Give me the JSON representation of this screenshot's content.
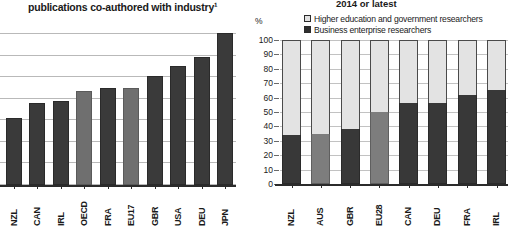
{
  "chart_data": [
    {
      "id": "left",
      "type": "bar",
      "title": "publications co-authored with industry¹",
      "xlabel": "",
      "ylabel": "",
      "grid": true,
      "gridlines": 8,
      "ylim": [
        0,
        100
      ],
      "categories": [
        "NZL",
        "CAN",
        "IRL",
        "OECD",
        "FRA",
        "EU17",
        "GBR",
        "USA",
        "DEU",
        "JPN"
      ],
      "values": [
        44,
        54,
        55,
        62,
        64,
        64,
        72,
        78,
        84,
        100
      ],
      "aggregate_categories": [
        "OECD",
        "EU17"
      ],
      "colors": {
        "bar": "#3a3a3a",
        "aggregate_bar": "#6f6f6f",
        "grid": "#b9b9b9"
      },
      "note": "y-axis tick labels are cropped out of frame on the left edge"
    },
    {
      "id": "right",
      "type": "bar",
      "subtype": "stacked-100",
      "title": "2014 or latest",
      "xlabel": "",
      "ylabel": "%",
      "grid": true,
      "ylim": [
        0,
        100
      ],
      "yticks": [
        100,
        90,
        80,
        70,
        60,
        50,
        40,
        30,
        20,
        10,
        0
      ],
      "legend_position": "top",
      "categories": [
        "NZL",
        "AUS",
        "GBR",
        "EU28",
        "CAN",
        "DEU",
        "FRA",
        "IRL"
      ],
      "series": [
        {
          "name": "Business enterprise researchers",
          "key": "business",
          "color": "#383838",
          "values": [
            34,
            35,
            38,
            50,
            56,
            56,
            62,
            65
          ]
        },
        {
          "name": "Higher education and government researchers",
          "key": "higher_ed_gov",
          "color": "#e3e3e3",
          "values": [
            66,
            65,
            62,
            50,
            44,
            44,
            38,
            35
          ]
        }
      ],
      "aggregate_categories": [
        "AUS",
        "EU28"
      ],
      "colors": {
        "aggregate_bar": "#7d7d7d",
        "grid": "#c2c2c2"
      }
    }
  ],
  "left": {
    "title": "publications co-authored with industry¹",
    "categories": [
      "NZL",
      "CAN",
      "IRL",
      "OECD",
      "FRA",
      "EU17",
      "GBR",
      "USA",
      "DEU",
      "JPN"
    ]
  },
  "right": {
    "title": "2014 or latest",
    "axis_unit": "%",
    "legend": [
      {
        "label": "Higher education and government researchers",
        "swatch": "light"
      },
      {
        "label": "Business enterprise researchers",
        "swatch": "dark"
      }
    ],
    "ytick_labels": [
      "100",
      "90",
      "80",
      "70",
      "60",
      "50",
      "40",
      "30",
      "20",
      "10",
      "0"
    ],
    "categories": [
      "NZL",
      "AUS",
      "GBR",
      "EU28",
      "CAN",
      "DEU",
      "FRA",
      "IRL"
    ]
  }
}
